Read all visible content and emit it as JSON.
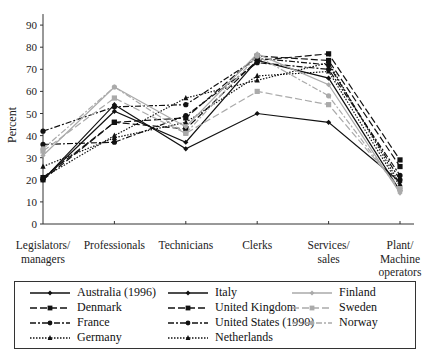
{
  "chart_data": {
    "type": "line",
    "title": "",
    "xlabel": "",
    "ylabel": "Percent",
    "ylim": [
      0,
      95
    ],
    "yticks": [
      0,
      10,
      20,
      30,
      40,
      50,
      60,
      70,
      80,
      90
    ],
    "grid": false,
    "legend_position": "bottom",
    "categories": [
      "Legislators/ managers",
      "Professionals",
      "Technicians",
      "Clerks",
      "Services/ sales",
      "Plant/ Machine operators"
    ],
    "category_lines": [
      [
        "Legislators/",
        "managers"
      ],
      [
        "Professionals"
      ],
      [
        "Technicians"
      ],
      [
        "Clerks"
      ],
      [
        "Services/",
        "sales"
      ],
      [
        "Plant/",
        "Machine",
        "operators"
      ]
    ],
    "series": [
      {
        "name": "Australia (1996)",
        "values": [
          20,
          51,
          37,
          74,
          66,
          15
        ],
        "color": "#111111",
        "dash": "",
        "marker": "diamond"
      },
      {
        "name": "Denmark",
        "values": [
          20,
          46,
          43,
          74,
          77,
          29
        ],
        "color": "#111111",
        "dash": "7,3",
        "marker": "square"
      },
      {
        "name": "France",
        "values": [
          36,
          37,
          49,
          73,
          70,
          22
        ],
        "color": "#111111",
        "dash": "6,2,2,2",
        "marker": "circle"
      },
      {
        "name": "Germany",
        "values": [
          26,
          39,
          46,
          67,
          69,
          17
        ],
        "color": "#111111",
        "dash": "1.5,1.5",
        "marker": "triangle"
      },
      {
        "name": "Italy",
        "values": [
          20,
          54,
          34,
          50,
          46,
          19
        ],
        "color": "#111111",
        "dash": "",
        "marker": "diamond"
      },
      {
        "name": "United Kingdom",
        "values": [
          21,
          46,
          48,
          76,
          74,
          26
        ],
        "color": "#111111",
        "dash": "7,3",
        "marker": "square"
      },
      {
        "name": "United States (1990)",
        "values": [
          42,
          53,
          54,
          75,
          72,
          20
        ],
        "color": "#111111",
        "dash": "6,2,2,2",
        "marker": "circle"
      },
      {
        "name": "Netherlands",
        "values": [
          21,
          40,
          57,
          65,
          73,
          18
        ],
        "color": "#111111",
        "dash": "1.5,1.5",
        "marker": "triangle"
      },
      {
        "name": "Finland",
        "values": [
          31,
          62,
          44,
          77,
          63,
          14
        ],
        "color": "#aaaaaa",
        "dash": "",
        "marker": "diamond"
      },
      {
        "name": "Sweden",
        "values": [
          33,
          57,
          41,
          60,
          54,
          16
        ],
        "color": "#aaaaaa",
        "dash": "7,3",
        "marker": "square"
      },
      {
        "name": "Norway",
        "values": [
          34,
          62,
          41,
          76,
          58,
          15
        ],
        "color": "#aaaaaa",
        "dash": "6,2,2,2",
        "marker": "circle"
      }
    ]
  },
  "axes": {
    "y_label": "Percent"
  },
  "legend": {
    "columns": [
      [
        "Australia (1996)",
        "Denmark",
        "France",
        "Germany"
      ],
      [
        "Italy",
        "United Kingdom",
        "United States (1990)",
        "Netherlands"
      ],
      [
        "Finland",
        "Sweden",
        "Norway"
      ]
    ]
  }
}
